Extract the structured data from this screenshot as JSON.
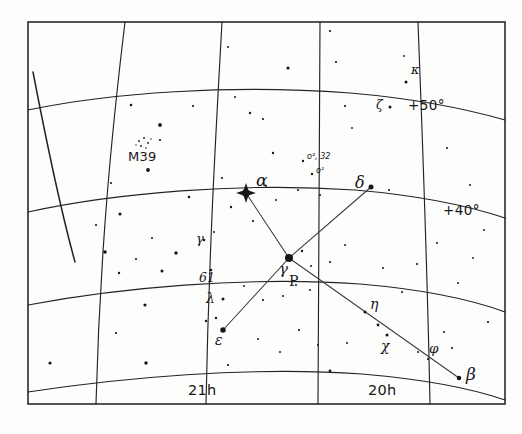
{
  "chart_data": {
    "type": "scatter",
    "xlabel": "Right Ascension",
    "ylabel": "Declination",
    "projection": "curved equatorial grid, hand-drawn",
    "grid": true,
    "legend": "none",
    "xlim": [
      "21h40m",
      "19h40m"
    ],
    "ylim": [
      33,
      57
    ],
    "ra_gridlines": [
      {
        "label": "",
        "label_visible": false,
        "x_top": 125,
        "x_bottom": 96
      },
      {
        "label": "21h",
        "label_visible": true,
        "x_top": 222,
        "x_bottom": 206
      },
      {
        "label": "",
        "label_visible": false,
        "x_top": 320,
        "x_bottom": 318
      },
      {
        "label": "20h",
        "label_visible": true,
        "x_top": 418,
        "x_bottom": 430
      }
    ],
    "dec_gridlines": [
      {
        "label": "",
        "label_visible": false,
        "value": 60
      },
      {
        "label": "+50°",
        "label_visible": true,
        "value": 50
      },
      {
        "label": "+40°",
        "label_visible": true,
        "value": 40
      },
      {
        "label": "",
        "label_visible": false,
        "value": 30
      }
    ],
    "stars": [
      {
        "name": "alpha",
        "label": "α",
        "common": "Deneb",
        "x": 246,
        "y": 193,
        "mag_size": 9,
        "marker": "spiked"
      },
      {
        "name": "gamma",
        "label": "γ",
        "common": "Sadr",
        "x": 289,
        "y": 258,
        "mag_size": 8,
        "marker": "dot"
      },
      {
        "name": "delta",
        "label": "δ",
        "common": "",
        "x": 371,
        "y": 187,
        "mag_size": 5,
        "marker": "dot"
      },
      {
        "name": "epsilon",
        "label": "ε",
        "common": "Gienah",
        "x": 223,
        "y": 330,
        "mag_size": 5.5,
        "marker": "dot"
      },
      {
        "name": "beta",
        "label": "β",
        "common": "Albireo",
        "x": 459,
        "y": 378,
        "mag_size": 4.5,
        "marker": "dot"
      },
      {
        "name": "eta",
        "label": "η",
        "common": "",
        "x": 365,
        "y": 312,
        "mag_size": 3,
        "marker": "dot"
      },
      {
        "name": "chi",
        "label": "χ",
        "common": "",
        "x": 387,
        "y": 335,
        "mag_size": 3,
        "marker": "dot"
      },
      {
        "name": "phi",
        "label": "φ",
        "common": "",
        "x": 428,
        "y": 359,
        "mag_size": 2.2,
        "marker": "dot"
      },
      {
        "name": "lambda",
        "label": "λ",
        "common": "",
        "x": 223,
        "y": 299,
        "mag_size": 3,
        "marker": "dot"
      },
      {
        "name": "kappa",
        "label": "κ",
        "common": "",
        "x": 406,
        "y": 82,
        "mag_size": 3,
        "marker": "dot"
      },
      {
        "name": "zeta",
        "label": "ζ",
        "common": "",
        "x": 390,
        "y": 107,
        "mag_size": 3,
        "marker": "dot"
      },
      {
        "name": "gamma-lower",
        "label": "γ",
        "common": "",
        "x": 204,
        "y": 240,
        "mag_size": 2.6,
        "marker": "dot"
      },
      {
        "name": "omicron2",
        "label": "o², 32",
        "common": "",
        "x": 303,
        "y": 161,
        "mag_size": 2.4,
        "marker": "dot"
      },
      {
        "name": "omicron1",
        "label": "o¹",
        "common": "",
        "x": 312,
        "y": 174,
        "mag_size": 2.4,
        "marker": "dot"
      },
      {
        "name": "61-cygni",
        "label": "61",
        "common": "",
        "x": 211,
        "y": 270,
        "mag_size": 2.6,
        "marker": "dot"
      }
    ],
    "deep_sky": [
      {
        "name": "m39",
        "label": "M39",
        "type": "open cluster",
        "x": 143,
        "y": 144
      }
    ],
    "asterism_lines": [
      {
        "from": "alpha",
        "to": "gamma"
      },
      {
        "from": "gamma",
        "to": "delta"
      },
      {
        "from": "gamma",
        "to": "epsilon"
      },
      {
        "from": "gamma",
        "to": "beta"
      }
    ],
    "field_stars": [
      {
        "x": 160,
        "y": 125,
        "r": 1.9
      },
      {
        "x": 131,
        "y": 105,
        "r": 1.3
      },
      {
        "x": 193,
        "y": 106,
        "r": 1.1
      },
      {
        "x": 148,
        "y": 170,
        "r": 1.9
      },
      {
        "x": 111,
        "y": 183,
        "r": 1.1
      },
      {
        "x": 189,
        "y": 197,
        "r": 1.3
      },
      {
        "x": 222,
        "y": 178,
        "r": 1.1
      },
      {
        "x": 231,
        "y": 207,
        "r": 1.2
      },
      {
        "x": 253,
        "y": 221,
        "r": 1.1
      },
      {
        "x": 214,
        "y": 232,
        "r": 1.0
      },
      {
        "x": 120,
        "y": 214,
        "r": 1.6
      },
      {
        "x": 96,
        "y": 225,
        "r": 1.1
      },
      {
        "x": 152,
        "y": 238,
        "r": 1.0
      },
      {
        "x": 176,
        "y": 253,
        "r": 1.7
      },
      {
        "x": 136,
        "y": 259,
        "r": 1.1
      },
      {
        "x": 119,
        "y": 273,
        "r": 1.2
      },
      {
        "x": 162,
        "y": 271,
        "r": 1.5
      },
      {
        "x": 105,
        "y": 252,
        "r": 1.8
      },
      {
        "x": 145,
        "y": 305,
        "r": 1.6
      },
      {
        "x": 206,
        "y": 321,
        "r": 1.2
      },
      {
        "x": 50,
        "y": 363,
        "r": 1.6
      },
      {
        "x": 146,
        "y": 363,
        "r": 1.7
      },
      {
        "x": 116,
        "y": 333,
        "r": 1.1
      },
      {
        "x": 228,
        "y": 365,
        "r": 1.1
      },
      {
        "x": 263,
        "y": 119,
        "r": 1.1
      },
      {
        "x": 288,
        "y": 68,
        "r": 1.6
      },
      {
        "x": 330,
        "y": 31,
        "r": 1.1
      },
      {
        "x": 336,
        "y": 62,
        "r": 1.1
      },
      {
        "x": 345,
        "y": 106,
        "r": 1.1
      },
      {
        "x": 352,
        "y": 128,
        "r": 0.9
      },
      {
        "x": 273,
        "y": 153,
        "r": 1.2
      },
      {
        "x": 266,
        "y": 186,
        "r": 1.0
      },
      {
        "x": 276,
        "y": 200,
        "r": 1.0
      },
      {
        "x": 298,
        "y": 190,
        "r": 1.1
      },
      {
        "x": 320,
        "y": 195,
        "r": 1.1
      },
      {
        "x": 389,
        "y": 190,
        "r": 1.0
      },
      {
        "x": 302,
        "y": 251,
        "r": 1.2
      },
      {
        "x": 311,
        "y": 266,
        "r": 1.0
      },
      {
        "x": 330,
        "y": 262,
        "r": 1.1
      },
      {
        "x": 345,
        "y": 245,
        "r": 1.0
      },
      {
        "x": 296,
        "y": 285,
        "r": 1.0
      },
      {
        "x": 310,
        "y": 290,
        "r": 1.0
      },
      {
        "x": 283,
        "y": 296,
        "r": 1.0
      },
      {
        "x": 263,
        "y": 300,
        "r": 1.1
      },
      {
        "x": 383,
        "y": 268,
        "r": 1.0
      },
      {
        "x": 417,
        "y": 264,
        "r": 1.1
      },
      {
        "x": 402,
        "y": 292,
        "r": 1.0
      },
      {
        "x": 437,
        "y": 243,
        "r": 1.0
      },
      {
        "x": 347,
        "y": 343,
        "r": 1.0
      },
      {
        "x": 378,
        "y": 325,
        "r": 1.4
      },
      {
        "x": 299,
        "y": 330,
        "r": 1.1
      },
      {
        "x": 318,
        "y": 345,
        "r": 1.0
      },
      {
        "x": 280,
        "y": 352,
        "r": 1.0
      },
      {
        "x": 418,
        "y": 352,
        "r": 1.0
      },
      {
        "x": 452,
        "y": 348,
        "r": 1.1
      },
      {
        "x": 488,
        "y": 322,
        "r": 1.1
      },
      {
        "x": 330,
        "y": 371,
        "r": 1.4
      },
      {
        "x": 444,
        "y": 332,
        "r": 1.0
      },
      {
        "x": 258,
        "y": 339,
        "r": 1.0
      },
      {
        "x": 244,
        "y": 286,
        "r": 1.0
      },
      {
        "x": 216,
        "y": 318,
        "r": 1.2
      },
      {
        "x": 404,
        "y": 56,
        "r": 0.9
      },
      {
        "x": 228,
        "y": 47,
        "r": 1.0
      },
      {
        "x": 235,
        "y": 97,
        "r": 1.0
      },
      {
        "x": 250,
        "y": 113,
        "r": 1.2
      },
      {
        "x": 447,
        "y": 148,
        "r": 1.0
      },
      {
        "x": 470,
        "y": 185,
        "r": 1.0
      },
      {
        "x": 458,
        "y": 283,
        "r": 1.0
      },
      {
        "x": 473,
        "y": 258,
        "r": 0.9
      },
      {
        "x": 484,
        "y": 230,
        "r": 1.0
      }
    ]
  },
  "labels": {
    "alpha": "α",
    "beta": "β",
    "gamma_center": "γ",
    "gamma_left": "γ",
    "delta": "δ",
    "epsilon": "ε",
    "zeta": "ζ",
    "eta": "η",
    "kappa": "κ",
    "lambda": "λ",
    "chi": "χ",
    "phi": "φ",
    "p_cygni": "P",
    "m39": "M39",
    "omicron2": "o², 32",
    "omicron1": "o¹",
    "star61": "61",
    "dec50": "+50°",
    "dec40": "+40°",
    "ra21": "21h",
    "ra20": "20h"
  },
  "style": {
    "ink": "#16161a",
    "paper": "#fdfdfb",
    "grid_stroke": "#232327",
    "frame_stroke": "#2a2a2e"
  }
}
